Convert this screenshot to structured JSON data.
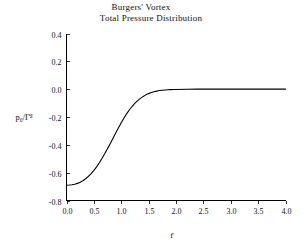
{
  "chart_data": {
    "type": "line",
    "title": "Burgers' Vortex",
    "subtitle": "Total Pressure Distribution",
    "title_lines": [
      "Burgers' Vortex",
      "Total Pressure Distribution"
    ],
    "xlabel": "r̄",
    "ylabel": "p₀/Γ̄²",
    "xlim": [
      0.0,
      4.0
    ],
    "ylim": [
      -0.8,
      0.4
    ],
    "grid": false,
    "legend": null,
    "xticks": [
      0.0,
      0.5,
      1.0,
      1.5,
      2.0,
      2.5,
      3.0,
      3.5,
      4.0
    ],
    "xtick_labels": [
      "0.0",
      "0.5",
      "1.0",
      "1.5",
      "2.0",
      "2.5",
      "3.0",
      "3.5",
      "4.0"
    ],
    "yticks": [
      0.4,
      0.2,
      0.0,
      -0.2,
      -0.4,
      -0.6,
      -0.8
    ],
    "ytick_labels": [
      "0.4",
      "0.2",
      "0.0",
      "-0.2",
      "-0.4",
      "-0.6",
      "-0.8"
    ],
    "series": [
      {
        "name": "total pressure",
        "color": "#000000",
        "x": [
          0.0,
          0.05,
          0.1,
          0.15,
          0.2,
          0.25,
          0.3,
          0.35,
          0.4,
          0.45,
          0.5,
          0.55,
          0.6,
          0.65,
          0.7,
          0.75,
          0.8,
          0.85,
          0.9,
          0.95,
          1.0,
          1.05,
          1.1,
          1.15,
          1.2,
          1.25,
          1.3,
          1.35,
          1.4,
          1.45,
          1.5,
          1.55,
          1.6,
          1.65,
          1.7,
          1.75,
          1.8,
          1.85,
          1.9,
          1.95,
          2.0,
          2.2,
          2.4,
          2.6,
          2.8,
          3.0,
          3.2,
          3.4,
          3.6,
          3.8,
          4.0
        ],
        "y": [
          -0.69,
          -0.689,
          -0.687,
          -0.683,
          -0.677,
          -0.669,
          -0.658,
          -0.644,
          -0.627,
          -0.607,
          -0.584,
          -0.558,
          -0.529,
          -0.497,
          -0.463,
          -0.427,
          -0.39,
          -0.352,
          -0.314,
          -0.277,
          -0.241,
          -0.207,
          -0.176,
          -0.148,
          -0.123,
          -0.101,
          -0.082,
          -0.066,
          -0.052,
          -0.041,
          -0.032,
          -0.024,
          -0.018,
          -0.014,
          -0.01,
          -0.008,
          -0.006,
          -0.004,
          -0.003,
          -0.002,
          -0.002,
          -0.001,
          0.0,
          0.0,
          0.0,
          0.0,
          0.0,
          0.0,
          0.0,
          0.0,
          0.0
        ]
      }
    ],
    "annotations": [
      {
        "text": "curve starts at approximately -0.69 at r̄ = 0 and asymptotes to 0 beyond r̄ ≈ 2.0"
      }
    ]
  },
  "axes": {
    "x_axis_title": "r̄",
    "y_axis_title": "p₀/Γ̄²"
  }
}
